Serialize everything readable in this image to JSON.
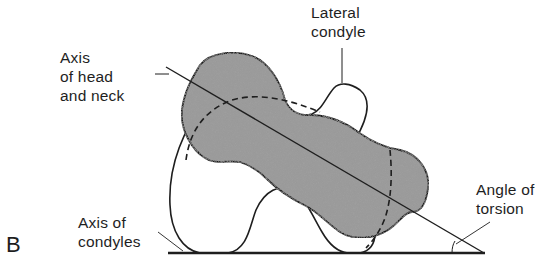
{
  "figure": {
    "panel_letter": "B",
    "labels": {
      "axis_head_neck": "Axis\nof head\nand neck",
      "lateral_condyle": "Lateral\ncondyle",
      "angle_of_torsion": "Angle of\ntorsion",
      "axis_of_condyles": "Axis of\ncondyles"
    },
    "colors": {
      "ink": "#1e1e1e",
      "bone_fill": "#9a9a9a",
      "background": "#ffffff"
    }
  }
}
